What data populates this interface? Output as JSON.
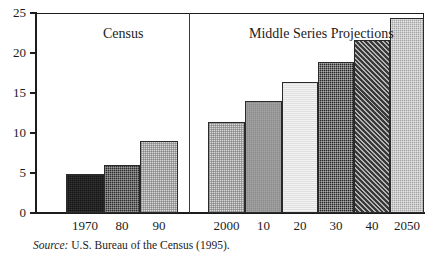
{
  "figure": {
    "top_clipped_caption": "",
    "source_prefix": "Source:",
    "source_text": "U.S. Bureau of the Census (1995)."
  },
  "panels": {
    "left_title": "Census",
    "right_title": "Middle Series Projections"
  },
  "chart_data": {
    "type": "bar",
    "title": "",
    "subtitle": "",
    "xlabel": "",
    "ylabel": "",
    "ylim": [
      0,
      25
    ],
    "yticks": [
      0,
      5,
      10,
      15,
      20,
      25
    ],
    "ytick_labels": [
      "0",
      "5",
      "10",
      "15",
      "20",
      "25"
    ],
    "grid": false,
    "legend": "none",
    "panel_divider_after_index": 2,
    "categories": [
      "1970",
      "80",
      "90",
      "2000",
      "10",
      "20",
      "30",
      "40",
      "2050"
    ],
    "values": [
      4.9,
      6.0,
      9.0,
      11.4,
      14.0,
      16.4,
      18.9,
      21.6,
      24.4
    ],
    "groups": [
      {
        "name": "Census",
        "categories": [
          "1970",
          "80",
          "90"
        ],
        "values": [
          4.9,
          6.0,
          9.0
        ]
      },
      {
        "name": "Middle Series Projections",
        "categories": [
          "2000",
          "10",
          "20",
          "30",
          "40",
          "2050"
        ],
        "values": [
          11.4,
          14.0,
          16.4,
          18.9,
          21.6,
          24.4
        ]
      }
    ],
    "bars": [
      {
        "label": "1970",
        "value": 4.9,
        "group": "Census",
        "fill": "solid-black",
        "color": "#141414"
      },
      {
        "label": "80",
        "value": 6.0,
        "group": "Census",
        "fill": "dark-cross",
        "color": "#2e2e2e"
      },
      {
        "label": "90",
        "value": 9.0,
        "group": "Census",
        "fill": "light-dot",
        "color": "#d8d8d8"
      },
      {
        "label": "2000",
        "value": 11.4,
        "group": "Middle Series Projections",
        "fill": "light-dot",
        "color": "#cdcdcd"
      },
      {
        "label": "10",
        "value": 14.0,
        "group": "Middle Series Projections",
        "fill": "medium-gray",
        "color": "#8d8d8d"
      },
      {
        "label": "20",
        "value": 16.4,
        "group": "Middle Series Projections",
        "fill": "very-light",
        "color": "#f2f2f2"
      },
      {
        "label": "30",
        "value": 18.9,
        "group": "Middle Series Projections",
        "fill": "dark-check",
        "color": "#232323"
      },
      {
        "label": "40",
        "value": 21.6,
        "group": "Middle Series Projections",
        "fill": "diag-hatch",
        "color": "#3a3a3a"
      },
      {
        "label": "2050",
        "value": 24.4,
        "group": "Middle Series Projections",
        "fill": "gray-dot",
        "color": "#a5a5a5"
      }
    ]
  },
  "colors": {
    "axis": "#1c1c1c",
    "divider": "#3c3c3c",
    "text": "#1c1c1c",
    "background": "#ffffff"
  }
}
